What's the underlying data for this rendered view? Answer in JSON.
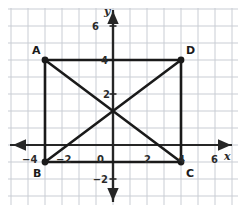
{
  "figure": {
    "background_color": "#ffffff",
    "grid": {
      "visible": true,
      "line_color": "#c9cdd4",
      "spacing_units": 1,
      "x_range": [
        -6,
        7
      ],
      "y_range": [
        -3,
        8
      ]
    },
    "axes": {
      "line_color": "#262626",
      "x_axis": {
        "name": "x",
        "tick_labels": [
          {
            "text": "−4",
            "value": -4
          },
          {
            "text": "−2",
            "value": -2
          },
          {
            "text": "0",
            "value": 0
          },
          {
            "text": "2",
            "value": 2
          },
          {
            "text": "4",
            "value": 4
          },
          {
            "text": "6",
            "value": 6
          }
        ]
      },
      "y_axis": {
        "name": "y",
        "tick_labels": [
          {
            "text": "6",
            "value": 6
          },
          {
            "text": "4",
            "value": 4
          },
          {
            "text": "2",
            "value": 2
          },
          {
            "text": "−2",
            "value": -2
          }
        ]
      }
    },
    "shape": {
      "name": "rectangle ABCD",
      "stroke_color": "#1a1a1a",
      "vertices": [
        {
          "label": "A",
          "x": -4,
          "y": 4
        },
        {
          "label": "B",
          "x": -4,
          "y": -1
        },
        {
          "label": "C",
          "x": 4,
          "y": -1
        },
        {
          "label": "D",
          "x": 4,
          "y": 4
        }
      ],
      "sides": [
        {
          "from": "A",
          "to": "D"
        },
        {
          "from": "D",
          "to": "C"
        },
        {
          "from": "C",
          "to": "B"
        },
        {
          "from": "B",
          "to": "A"
        }
      ],
      "diagonals": [
        {
          "from": "A",
          "to": "C"
        },
        {
          "from": "B",
          "to": "D"
        }
      ]
    }
  }
}
